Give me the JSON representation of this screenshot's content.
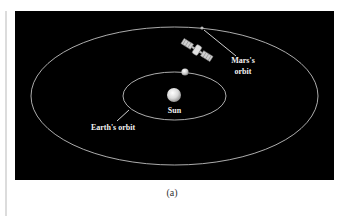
{
  "figure": {
    "caption": "(a)",
    "background_color": "#000000",
    "orbit_color": "#d8d8d8",
    "label_color": "#f2f2f2",
    "labels": {
      "sun": "Sun",
      "earth_orbit": "Earth's orbit",
      "mars_orbit_line1": "Mars's",
      "mars_orbit_line2": "orbit"
    },
    "objects": [
      {
        "name": "Sun",
        "type": "star"
      },
      {
        "name": "Earth",
        "type": "planet"
      },
      {
        "name": "Mars",
        "type": "planet"
      },
      {
        "name": "Spacecraft",
        "type": "satellite"
      }
    ],
    "orbits": [
      {
        "name": "Earth's orbit",
        "shape": "ellipse"
      },
      {
        "name": "Mars's orbit",
        "shape": "ellipse"
      }
    ]
  }
}
